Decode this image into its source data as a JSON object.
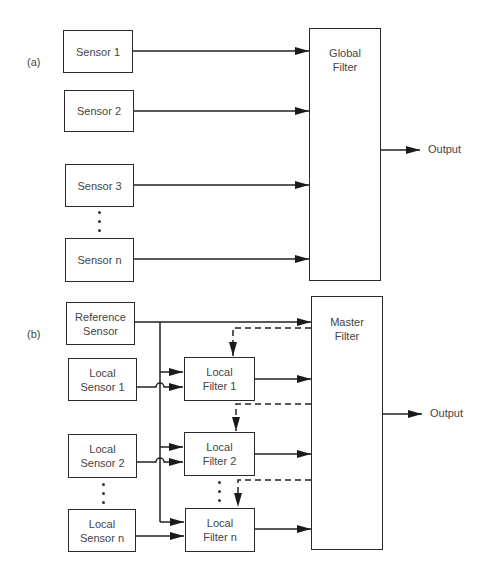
{
  "panel_a": {
    "label": "(a)",
    "sensors": [
      "Sensor 1",
      "Sensor 2",
      "Sensor 3",
      "Sensor n"
    ],
    "filter": "Global\nFilter",
    "filter_line1": "Global",
    "filter_line2": "Filter",
    "output": "Output"
  },
  "panel_b": {
    "label": "(b)",
    "reference": {
      "line1": "Reference",
      "line2": "Sensor"
    },
    "local_sensors": [
      {
        "line1": "Local",
        "line2": "Sensor 1"
      },
      {
        "line1": "Local",
        "line2": "Sensor 2"
      },
      {
        "line1": "Local",
        "line2": "Sensor n"
      }
    ],
    "local_filters": [
      {
        "line1": "Local",
        "line2": "Filter 1"
      },
      {
        "line1": "Local",
        "line2": "Filter 2"
      },
      {
        "line1": "Local",
        "line2": "Filter n"
      }
    ],
    "master": {
      "line1": "Master",
      "line2": "Filter"
    },
    "output": "Output"
  },
  "colors": {
    "line": "#222222",
    "text": "#444444",
    "background": "#ffffff"
  }
}
